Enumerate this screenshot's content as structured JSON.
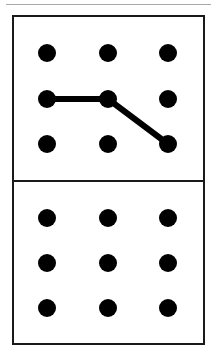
{
  "canvas": {
    "width": 217,
    "height": 361,
    "background_color": "#ffffff"
  },
  "top_rule": {
    "label": "top horizontal rule",
    "color": "#a8a8a8"
  },
  "card": {
    "label": "dot grid card",
    "border_color": "#1a1a1a",
    "fill_color": "#ffffff",
    "divider_label": "half divider"
  },
  "dot_style": {
    "color": "#000000",
    "diameter": 18
  },
  "path_style": {
    "color": "#000000",
    "stroke_width": 6
  },
  "panels": [
    {
      "name": "top-panel",
      "label": "Top panel",
      "grid": {
        "rows": 3,
        "cols": 3,
        "col_x": [
          47,
          108,
          168
        ],
        "row_y": [
          53,
          99,
          144
        ]
      },
      "dots": [
        {
          "id": "t-r1c1",
          "label": "row 1 column 1",
          "x": 47,
          "y": 53,
          "selected": false
        },
        {
          "id": "t-r1c2",
          "label": "row 1 column 2",
          "x": 108,
          "y": 53,
          "selected": false
        },
        {
          "id": "t-r1c3",
          "label": "row 1 column 3",
          "x": 168,
          "y": 53,
          "selected": false
        },
        {
          "id": "t-r2c1",
          "label": "row 2 column 1",
          "x": 47,
          "y": 99,
          "selected": true
        },
        {
          "id": "t-r2c2",
          "label": "row 2 column 2",
          "x": 108,
          "y": 99,
          "selected": true
        },
        {
          "id": "t-r2c3",
          "label": "row 2 column 3",
          "x": 168,
          "y": 99,
          "selected": false
        },
        {
          "id": "t-r3c1",
          "label": "row 3 column 1",
          "x": 47,
          "y": 144,
          "selected": false
        },
        {
          "id": "t-r3c2",
          "label": "row 3 column 2",
          "x": 108,
          "y": 144,
          "selected": false
        },
        {
          "id": "t-r3c3",
          "label": "row 3 column 3",
          "x": 168,
          "y": 144,
          "selected": true
        }
      ],
      "path": {
        "label": "connection path",
        "nodes": [
          "t-r2c1",
          "t-r2c2",
          "t-r3c3"
        ],
        "points": [
          {
            "x": 47,
            "y": 99
          },
          {
            "x": 108,
            "y": 99
          },
          {
            "x": 168,
            "y": 144
          }
        ]
      }
    },
    {
      "name": "bottom-panel",
      "label": "Bottom panel",
      "grid": {
        "rows": 3,
        "cols": 3,
        "col_x": [
          47,
          108,
          168
        ],
        "row_y": [
          218,
          263,
          308
        ]
      },
      "dots": [
        {
          "id": "b-r1c1",
          "label": "row 1 column 1",
          "x": 47,
          "y": 218,
          "selected": false
        },
        {
          "id": "b-r1c2",
          "label": "row 1 column 2",
          "x": 108,
          "y": 218,
          "selected": false
        },
        {
          "id": "b-r1c3",
          "label": "row 1 column 3",
          "x": 168,
          "y": 218,
          "selected": false
        },
        {
          "id": "b-r2c1",
          "label": "row 2 column 1",
          "x": 47,
          "y": 263,
          "selected": false
        },
        {
          "id": "b-r2c2",
          "label": "row 2 column 2",
          "x": 108,
          "y": 263,
          "selected": false
        },
        {
          "id": "b-r2c3",
          "label": "row 2 column 3",
          "x": 168,
          "y": 263,
          "selected": false
        },
        {
          "id": "b-r3c1",
          "label": "row 3 column 1",
          "x": 47,
          "y": 308,
          "selected": false
        },
        {
          "id": "b-r3c2",
          "label": "row 3 column 2",
          "x": 108,
          "y": 308,
          "selected": false
        },
        {
          "id": "b-r3c3",
          "label": "row 3 column 3",
          "x": 168,
          "y": 308,
          "selected": false
        }
      ],
      "path": {
        "label": "connection path",
        "nodes": [],
        "points": []
      }
    }
  ]
}
